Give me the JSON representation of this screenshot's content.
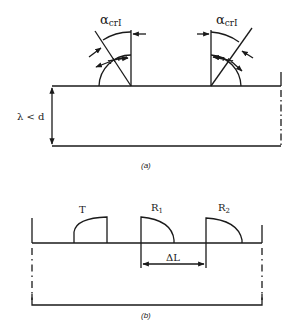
{
  "figure": {
    "ink_color": "#1a1a1a",
    "background": "#ffffff",
    "panels": [
      {
        "id": "a",
        "caption": "(a)",
        "description": "Angle probes on a plate of thickness d greater than wavelength",
        "thickness_label": "λ < d",
        "angle_label_main": "α",
        "angle_label_sub": "crI",
        "probes": [
          {
            "name": "left-angle-probe",
            "orientation": "tilted-left",
            "angle_label": "αcrI"
          },
          {
            "name": "right-angle-probe",
            "orientation": "tilted-right",
            "angle_label": "αcrI"
          }
        ]
      },
      {
        "id": "b",
        "caption": "(b)",
        "description": "Transmitter and two receivers on a surface",
        "transmitter_label": "T",
        "receiver1_label": "R",
        "receiver1_sub": "1",
        "receiver2_label": "R",
        "receiver2_sub": "2",
        "spacing_label": "ΔL"
      }
    ]
  }
}
